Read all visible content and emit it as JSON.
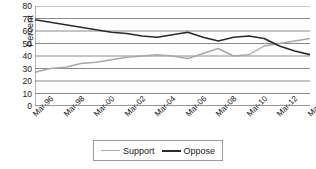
{
  "chart_data": {
    "type": "line",
    "title": "",
    "xlabel": "",
    "ylabel": "Percent",
    "ylim": [
      0,
      80
    ],
    "ytick_step": 10,
    "yticks": [
      80,
      70,
      60,
      50,
      40,
      30,
      20,
      10,
      0
    ],
    "grid": true,
    "grid_axis": "y",
    "legend_position": "bottom-center",
    "x": [
      "Mar-96",
      "Mar-97",
      "Mar-98",
      "Mar-99",
      "Mar-00",
      "Mar-01",
      "Mar-02",
      "Mar-03",
      "Mar-04",
      "Mar-05",
      "Mar-06",
      "Mar-07",
      "Mar-08",
      "Mar-09",
      "Mar-10",
      "Mar-11",
      "Mar-12",
      "Mar-13",
      "Mar-14"
    ],
    "xtick_labels": [
      "Mar-96",
      "Mar-98",
      "Mar-00",
      "Mar-02",
      "Mar-04",
      "Mar-06",
      "Mar-08",
      "Mar-10",
      "Mar-12",
      "Mar-14"
    ],
    "series": [
      {
        "name": "Support",
        "color": "#a8a8a8",
        "values": [
          27,
          30,
          31,
          34,
          35,
          37,
          39,
          40,
          41,
          40,
          38,
          42,
          46,
          40,
          41,
          48,
          50,
          52,
          54
        ]
      },
      {
        "name": "Oppose",
        "color": "#2b2b2b",
        "values": [
          69,
          67,
          65,
          63,
          61,
          59,
          58,
          56,
          55,
          57,
          59,
          55,
          52,
          55,
          56,
          54,
          48,
          44,
          41
        ]
      }
    ]
  },
  "legend": {
    "items": [
      {
        "label": "Support",
        "color": "#a8a8a8"
      },
      {
        "label": "Oppose",
        "color": "#2b2b2b"
      }
    ]
  }
}
